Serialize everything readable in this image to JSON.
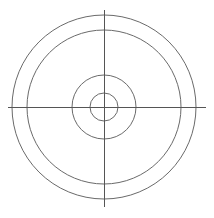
{
  "diagram": {
    "type": "concentric-circles-with-centerlines",
    "canvas": {
      "width": 214,
      "height": 218,
      "background": "#ffffff"
    },
    "center": {
      "x": 104,
      "y": 107
    },
    "circles": [
      {
        "name": "outer-circle",
        "r": 92
      },
      {
        "name": "second-circle",
        "r": 77
      },
      {
        "name": "middle-circle",
        "r": 32
      },
      {
        "name": "inner-circle",
        "r": 14
      }
    ],
    "centerlines": {
      "horizontal": {
        "x1": 8,
        "x2": 206,
        "y": 107
      },
      "vertical": {
        "x": 104,
        "y1": 10,
        "y2": 207
      }
    },
    "colors": {
      "circle_stroke": "#6a6a6a",
      "axis_stroke": "#555555"
    }
  }
}
